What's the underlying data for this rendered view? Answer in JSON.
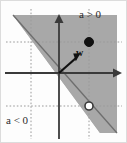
{
  "figure": {
    "type": "math-diagram",
    "background_color": "#fdfdfd",
    "border_color": "#d8d8d8",
    "shaded_region": {
      "name": "positive-halfplane",
      "fill_color": "#a8a8a8",
      "label": "a > 0"
    },
    "unshaded_region": {
      "name": "negative-halfplane",
      "fill_color": "#fdfdfd",
      "label": "a < 0"
    },
    "labels": {
      "positive": "a > 0",
      "negative": "a < 0",
      "vector": "w"
    },
    "axes": {
      "color": "#3a3a3a",
      "origin_x": 59,
      "origin_y": 73,
      "x_axis_arrow_tip_x": 121,
      "y_axis_arrow_tip_y": 14
    },
    "vector": {
      "name": "w",
      "from_x": 59,
      "from_y": 73,
      "to_x": 79,
      "to_y": 55,
      "color": "#111111"
    },
    "points": [
      {
        "name": "closed-point",
        "style": "filled",
        "x": 89,
        "y": 42,
        "fill": "#111111",
        "stroke": "#111111",
        "radius": 4.5
      },
      {
        "name": "open-point",
        "style": "open",
        "x": 89,
        "y": 106,
        "fill": "#ffffff",
        "stroke": "#3a3a3a",
        "radius": 4.0
      }
    ],
    "guide_lines": {
      "color": "#9a9a9a",
      "dash": "1.6 2.0",
      "vertical_x": [
        31,
        89
      ],
      "horizontal_y": [
        42,
        106
      ]
    },
    "boundary_line": {
      "name": "decision-boundary",
      "color": "#6e6e6e",
      "from_x": 13,
      "from_y": 15,
      "to_x": 117,
      "to_y": 133
    }
  }
}
